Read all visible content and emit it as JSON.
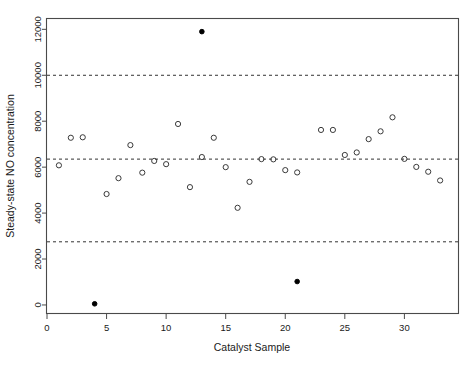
{
  "chart_data": {
    "type": "scatter",
    "title": "",
    "xlabel": "Catalyst Sample",
    "ylabel": "Steady-state NO concentration",
    "xlim": [
      0,
      34.5
    ],
    "ylim": [
      -350,
      12450
    ],
    "xticks": [
      0,
      5,
      10,
      15,
      20,
      25,
      30
    ],
    "yticks": [
      0,
      2000,
      4000,
      6000,
      8000,
      10000,
      12000
    ],
    "xtick_labels": [
      "0",
      "5",
      "10",
      "15",
      "20",
      "25",
      "30"
    ],
    "ytick_labels": [
      "0",
      "2000",
      "4000",
      "6000",
      "8000",
      "10000",
      "12000"
    ],
    "grid": false,
    "legend": "none",
    "reference_lines": [
      {
        "name": "upper-control-limit",
        "y": 10000,
        "style": "dashed"
      },
      {
        "name": "center-line",
        "y": 6350,
        "style": "dashed"
      },
      {
        "name": "lower-control-limit",
        "y": 2750,
        "style": "dashed"
      }
    ],
    "series": [
      {
        "name": "in-control",
        "marker": "open-circle",
        "color": "#3a3a3a",
        "points": [
          {
            "x": 1,
            "y": 6080
          },
          {
            "x": 2,
            "y": 7280
          },
          {
            "x": 3,
            "y": 7300
          },
          {
            "x": 5,
            "y": 4830
          },
          {
            "x": 6,
            "y": 5520
          },
          {
            "x": 7,
            "y": 6960
          },
          {
            "x": 8,
            "y": 5760
          },
          {
            "x": 9,
            "y": 6270
          },
          {
            "x": 10,
            "y": 6130
          },
          {
            "x": 11,
            "y": 7880
          },
          {
            "x": 12,
            "y": 5130
          },
          {
            "x": 13,
            "y": 6440
          },
          {
            "x": 14,
            "y": 7280
          },
          {
            "x": 15,
            "y": 6000
          },
          {
            "x": 16,
            "y": 4230
          },
          {
            "x": 17,
            "y": 5360
          },
          {
            "x": 18,
            "y": 6350
          },
          {
            "x": 19,
            "y": 6340
          },
          {
            "x": 20,
            "y": 5870
          },
          {
            "x": 21,
            "y": 5770
          },
          {
            "x": 23,
            "y": 7620
          },
          {
            "x": 24,
            "y": 7620
          },
          {
            "x": 25,
            "y": 6530
          },
          {
            "x": 26,
            "y": 6640
          },
          {
            "x": 27,
            "y": 7220
          },
          {
            "x": 28,
            "y": 7560
          },
          {
            "x": 29,
            "y": 8170
          },
          {
            "x": 30,
            "y": 6360
          },
          {
            "x": 31,
            "y": 6010
          },
          {
            "x": 32,
            "y": 5800
          },
          {
            "x": 33,
            "y": 5420
          }
        ]
      },
      {
        "name": "out-of-control",
        "marker": "filled-circle",
        "color": "#000000",
        "points": [
          {
            "x": 4,
            "y": 50
          },
          {
            "x": 13,
            "y": 11900
          },
          {
            "x": 21,
            "y": 1020
          }
        ]
      }
    ]
  }
}
